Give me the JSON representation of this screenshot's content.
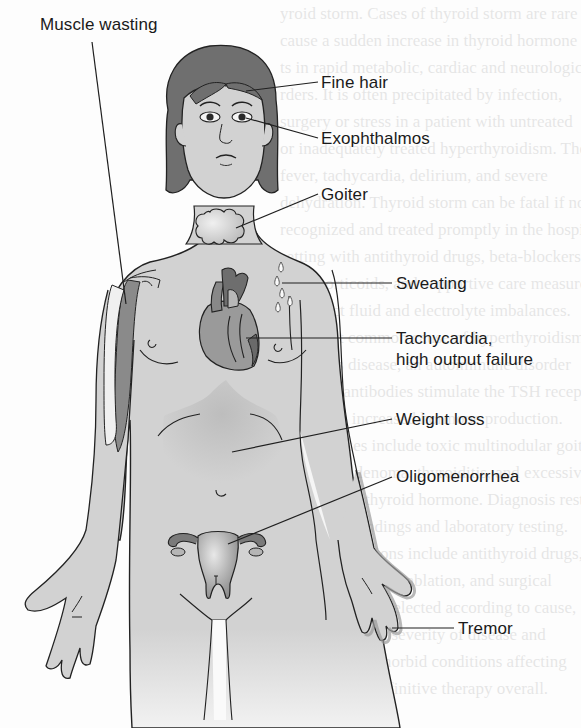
{
  "diagram": {
    "labels": [
      {
        "id": "muscle-wasting",
        "text": "Muscle wasting",
        "x": 40,
        "y": 14
      },
      {
        "id": "fine-hair",
        "text": "Fine hair",
        "x": 321,
        "y": 72
      },
      {
        "id": "exophthalmos",
        "text": "Exophthalmos",
        "x": 321,
        "y": 128
      },
      {
        "id": "goiter",
        "text": "Goiter",
        "x": 321,
        "y": 184
      },
      {
        "id": "sweating",
        "text": "Sweating",
        "x": 396,
        "y": 271
      },
      {
        "id": "tachycardia",
        "text": "Tachycardia,",
        "x": 396,
        "y": 326
      },
      {
        "id": "high-output-failure",
        "text": "high output failure",
        "x": 396,
        "y": 347
      },
      {
        "id": "weight-loss",
        "text": "Weight loss",
        "x": 396,
        "y": 408
      },
      {
        "id": "oligomenorrhea",
        "text": "Oligomenorrhea",
        "x": 396,
        "y": 465
      },
      {
        "id": "tremor",
        "text": "Tremor",
        "x": 458,
        "y": 617
      }
    ],
    "colors": {
      "skin": "#d4d4d4",
      "hair": "#6f6f6f",
      "outline": "#222222",
      "organ_dark": "#7a7a7a",
      "organ_mid": "#a9a9a9",
      "text": "#1a1a1a"
    }
  },
  "background_text": {
    "lines": [
      "yroid storm. Cases of thyroid storm are rare",
      "cause a sudden increase in thyroid hormone",
      "ts in rapid metabolic, cardiac and neurologic",
      "rders. It is often precipitated by infection,",
      "surgery or stress in a patient with untreated",
      "or inadequately treated hyperthyroidism. The",
      "fever, tachycardia, delirium, and severe",
      "dehydration. Thyroid storm can be fatal if not",
      "recognized and treated promptly in the hospital",
      "setting with antithyroid drugs, beta-blockers,",
      "glucocorticoids, and supportive care measures",
      "to correct fluid and electrolyte imbalances.",
      "The most common cause of hyperthyroidism",
      "is Graves disease, an autoimmune disorder",
      "in which antibodies stimulate the TSH receptor",
      "leading to increased hormone production.",
      "Other causes include toxic multinodular goiter",
      "and toxic adenoma, thyroiditis, and excessive",
      "ingestion of thyroid hormone. Diagnosis rests",
      "on clinical findings and laboratory testing.",
      "Treatment options include antithyroid drugs,",
      "radioactive iodine ablation, and surgical",
      "thyroidectomy, selected according to cause,",
      "patient age, and severity of disease and",
      "presence of comorbid conditions affecting",
      "the choice of definitive therapy overall."
    ]
  }
}
